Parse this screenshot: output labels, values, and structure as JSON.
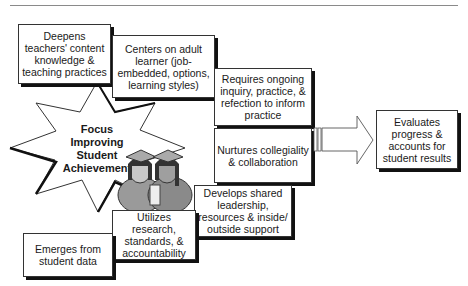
{
  "diagram": {
    "title": "Focus Improving Student Achievement",
    "center": {
      "lines": [
        "Focus",
        "Improving",
        "Student",
        "Achievement"
      ],
      "shape": "star",
      "illustration": "two-graduates-icon"
    },
    "steps": [
      {
        "id": "emerges",
        "label": "Emerges from student data"
      },
      {
        "id": "utilizes",
        "label": "Utilizes research, standards, & accountability"
      },
      {
        "id": "develops",
        "label": "Develops shared leadership, resources & inside/ outside support"
      },
      {
        "id": "nurtures",
        "label": "Nurtures collegiality & collaboration"
      },
      {
        "id": "requires",
        "label": "Requires ongoing inquiry, practice, & refection to inform practice"
      },
      {
        "id": "centers",
        "label": "Centers on adult learner (job-embedded, options, learning styles)"
      },
      {
        "id": "deepens",
        "label": "Deepens teachers' content knowledge & teaching practices"
      }
    ],
    "outcome": {
      "label": "Evaluates progress & accounts for student results",
      "connector": "block-arrow-right"
    }
  }
}
